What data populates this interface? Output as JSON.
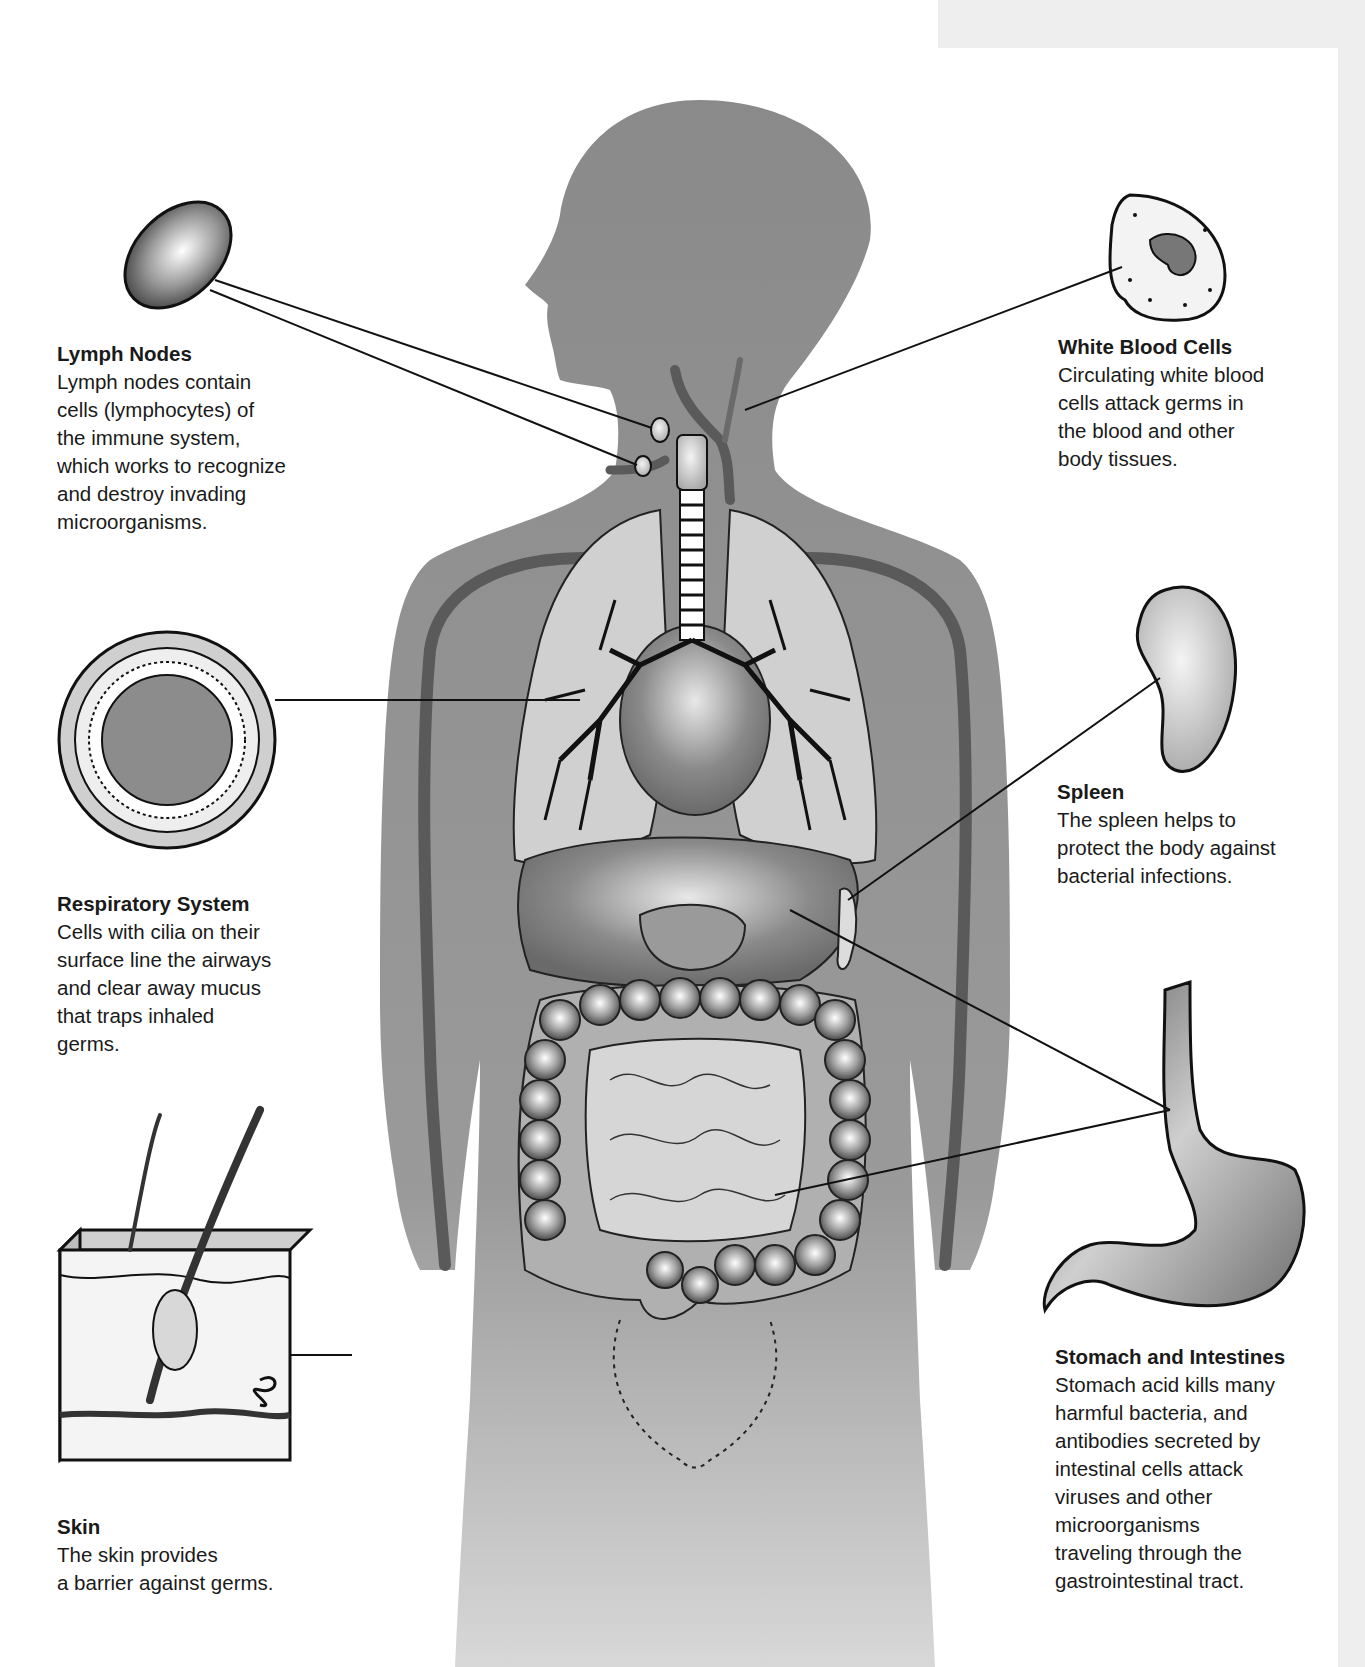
{
  "figure": {
    "background_color": "#ffffff",
    "band_color": "#eeeeee",
    "silhouette_color": "#8e8e8e",
    "vessel_color": "#5a5a5a"
  },
  "callouts": {
    "lymph_nodes": {
      "title": "Lymph Nodes",
      "desc": "Lymph nodes contain\ncells (lymphocytes) of\nthe immune system,\nwhich works to recognize\nand destroy invading\nmicroorganisms."
    },
    "white_blood_cells": {
      "title": "White Blood Cells",
      "desc": "Circulating white blood\ncells attack germs in\nthe blood and other\nbody tissues."
    },
    "respiratory_system": {
      "title": "Respiratory System",
      "desc": "Cells with cilia on their\nsurface line the airways\nand clear away mucus\nthat traps inhaled\ngerms."
    },
    "spleen": {
      "title": "Spleen",
      "desc": "The spleen helps to\nprotect the body against\nbacterial infections."
    },
    "stomach_intestines": {
      "title": "Stomach and Intestines",
      "desc": "Stomach acid kills many\nharmful bacteria, and\nantibodies secreted by\nintestinal cells attack\nviruses and other\nmicroorganisms\ntraveling through the\ngastrointestinal tract."
    },
    "skin": {
      "title": "Skin",
      "desc": "The skin provides\na barrier against germs."
    }
  }
}
